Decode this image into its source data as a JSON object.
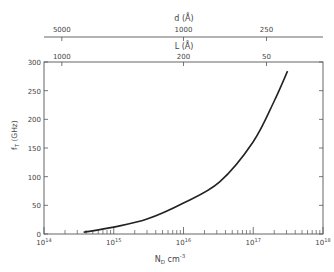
{
  "chart_data": {
    "type": "line",
    "title": "",
    "xlabel": "N_D cm^-3",
    "ylabel": "f_T (GHz)",
    "xscale": "log",
    "xlim": [
      100000000000000.0,
      1e+18
    ],
    "ylim": [
      0,
      300
    ],
    "grid": false,
    "legend": null,
    "x_ticks": [
      {
        "value": 100000000000000.0,
        "label_base": "10",
        "label_exp": "14"
      },
      {
        "value": 1000000000000000.0,
        "label_base": "10",
        "label_exp": "15"
      },
      {
        "value": 1e+16,
        "label_base": "10",
        "label_exp": "16"
      },
      {
        "value": 1e+17,
        "label_base": "10",
        "label_exp": "17"
      },
      {
        "value": 1e+18,
        "label_base": "10",
        "label_exp": "18"
      }
    ],
    "y_ticks": [
      0,
      50,
      100,
      150,
      200,
      250,
      300
    ],
    "top_axes": [
      {
        "label": "d (Å)",
        "ticks": [
          {
            "label": "5000",
            "at_x": 180000000000000.0
          },
          {
            "label": "1000",
            "at_x": 1e+16
          },
          {
            "label": "250",
            "at_x": 1.55e+17
          }
        ]
      },
      {
        "label": "L (Å)",
        "ticks": [
          {
            "label": "1000",
            "at_x": 180000000000000.0
          },
          {
            "label": "200",
            "at_x": 1e+16
          },
          {
            "label": "50",
            "at_x": 1.55e+17
          }
        ]
      }
    ],
    "series": [
      {
        "name": "f_T",
        "x": [
          370000000000000.0,
          1000000000000000.0,
          3000000000000000.0,
          1e+16,
          3.3e+16,
          1e+17,
          2e+17,
          3.1e+17
        ],
        "y": [
          3,
          12,
          26,
          54,
          91,
          161,
          232,
          284
        ]
      }
    ]
  },
  "labels": {
    "d_axis_title": "d (Å)",
    "l_axis_title": "L (Å)",
    "y_axis_title": "f",
    "y_axis_sub": "T",
    "y_axis_unit": " (GHz)",
    "x_axis_title_main": "N",
    "x_axis_title_sub": "D",
    "x_axis_title_unit": " cm",
    "x_axis_title_exp": "-3"
  }
}
